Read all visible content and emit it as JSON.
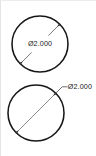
{
  "drawing": {
    "title": "Circle diameter dimensioning examples",
    "background_color": "#ffffff",
    "line_color": "#1b1b1b",
    "dimension_line_color": "#5a5a5a",
    "border_color": "#ececec",
    "diameter_symbol": "Ø",
    "figures": [
      {
        "id": "figure-top",
        "shape": "circle",
        "style": "dimension-inside",
        "center": {
          "x": 39,
          "y": 43
        },
        "radius": 28,
        "dimension": {
          "label": "Ø2.000",
          "value": "2.000",
          "symbol": "Ø",
          "placement": "inline-broken",
          "text_position": {
            "x": 39,
            "y": 43
          },
          "arrow_start": {
            "x": 19.2,
            "y": 62.8
          },
          "arrow_end": {
            "x": 58.8,
            "y": 23.2
          },
          "arrowheads": 2
        }
      },
      {
        "id": "figure-bottom",
        "shape": "circle",
        "style": "dimension-leader-outside",
        "center": {
          "x": 35,
          "y": 112
        },
        "radius": 28,
        "dimension": {
          "label": "Ø2.000",
          "value": "2.000",
          "symbol": "Ø",
          "placement": "leader-outside",
          "text_position": {
            "x": 64,
            "y": 85
          },
          "arrow_start": {
            "x": 15.2,
            "y": 131.8
          },
          "arrow_end": {
            "x": 54.8,
            "y": 92.2
          },
          "leader_elbow": {
            "x": 61,
            "y": 85
          },
          "leader_shelf_end": {
            "x": 64,
            "y": 85
          },
          "arrowheads": 2
        }
      }
    ]
  }
}
